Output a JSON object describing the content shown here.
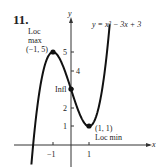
{
  "problem_number": "11.",
  "chart_data": {
    "type": "line",
    "title": "",
    "equation": "y = x^3 - 3x + 3",
    "xlabel": "x",
    "ylabel": "y",
    "xlim": [
      -2.3,
      3.3
    ],
    "ylim": [
      -1.2,
      5.9
    ],
    "x_ticks": [
      -1,
      1
    ],
    "y_ticks": [
      1,
      2,
      3,
      4,
      5
    ],
    "grid": false,
    "series": [
      {
        "name": "y = x^3 - 3x + 3",
        "function": "x^3 - 3x + 3",
        "x_range": [
          -2.2,
          2.15
        ]
      }
    ],
    "points": [
      {
        "x": -1,
        "y": 5,
        "label": "(-1, 5)",
        "annotation": "Loc max"
      },
      {
        "x": 0,
        "y": 3,
        "label": "",
        "annotation": "Infl"
      },
      {
        "x": 1,
        "y": 1,
        "label": "(1, 1)",
        "annotation": "Loc min"
      }
    ]
  },
  "labels": {
    "equation": "y = x³ − 3x + 3",
    "loc_max_1": "Loc",
    "loc_max_2": "max",
    "loc_max_pt": "(−1, 5)",
    "infl": "Infl",
    "loc_min_pt": "(1, 1)",
    "loc_min": "Loc min",
    "x_axis": "x",
    "y_axis": "y",
    "xt_neg1": "−1",
    "xt_1": "1",
    "yt_1": "1",
    "yt_2": "2",
    "yt_3": "3",
    "yt_4": "4",
    "yt_5": "5"
  }
}
